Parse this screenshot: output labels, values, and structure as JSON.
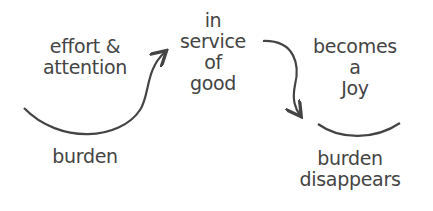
{
  "diagram": {
    "text_color": "#444444",
    "nodes": [
      {
        "id": "effort",
        "label": "effort &\nattention"
      },
      {
        "id": "burden",
        "label": "burden"
      },
      {
        "id": "service",
        "label": "in\nservice\nof\ngood"
      },
      {
        "id": "joy",
        "label": "becomes\na\nJoy"
      },
      {
        "id": "disappears",
        "label": "burden\ndisappears"
      }
    ],
    "edges": [
      {
        "from": "burden",
        "to": "service",
        "style": "curved-arrow"
      },
      {
        "from": "service",
        "to": "disappears",
        "style": "curved-arrow"
      }
    ],
    "shapes": [
      {
        "type": "smile-arc",
        "under": "joy"
      }
    ]
  }
}
